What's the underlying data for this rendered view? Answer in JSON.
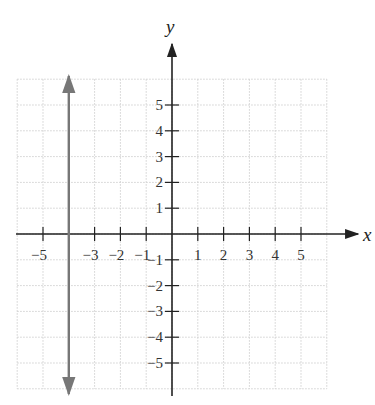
{
  "chart_data": {
    "type": "line",
    "title": "",
    "xlabel": "x",
    "ylabel": "y",
    "xlim": [
      -6,
      6
    ],
    "ylim": [
      -6,
      6
    ],
    "grid": true,
    "x_ticks": [
      -5,
      -3,
      -2,
      -1,
      1,
      2,
      3,
      4,
      5
    ],
    "x_tick_labels": [
      "−5",
      "−3",
      "−2",
      "−1",
      "1",
      "2",
      "3",
      "4",
      "5"
    ],
    "y_ticks": [
      5,
      4,
      3,
      2,
      1,
      -1,
      -2,
      -3,
      -4,
      -5
    ],
    "y_tick_labels": [
      "5",
      "4",
      "3",
      "2",
      "1",
      "−1",
      "−2",
      "−3",
      "−4",
      "−5"
    ],
    "series": [
      {
        "name": "x = -4",
        "kind": "vertical_line",
        "x": [
          -4,
          -4
        ],
        "y": [
          -6,
          6
        ],
        "arrows": "both",
        "color": "#777777"
      }
    ]
  },
  "colors": {
    "axis": "#222222",
    "grid": "#d0d0d0",
    "line": "#777777"
  }
}
